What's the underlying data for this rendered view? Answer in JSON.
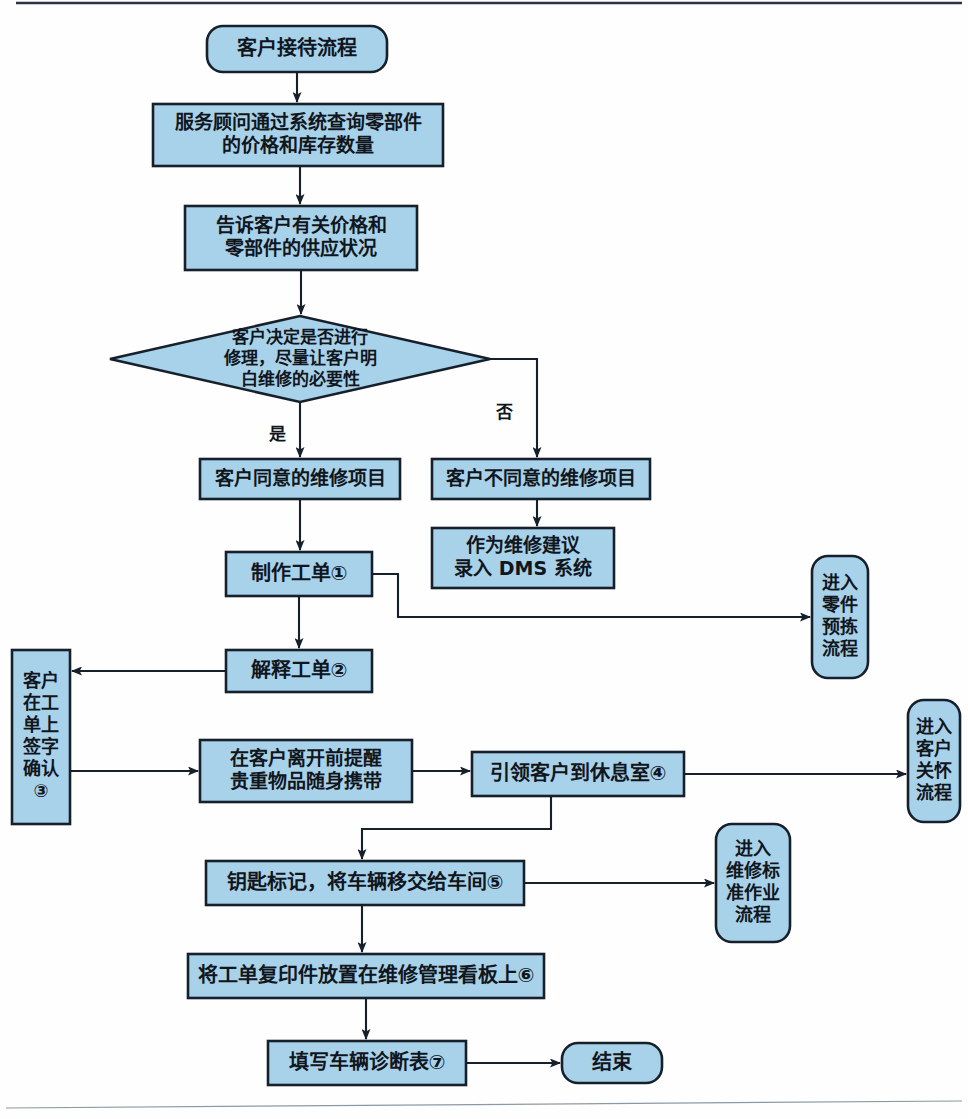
{
  "diagram": {
    "title": "客户接待流程",
    "type": "flowchart",
    "orientation": "top-to-bottom",
    "palette": {
      "node_fill": "#a8d1ea",
      "node_stroke": "#16202b",
      "connector": "#16202b",
      "background": "#fefefe",
      "text": "#10161c"
    },
    "nodes": [
      {
        "id": "start",
        "shape": "rounded",
        "label": "客户接待流程",
        "lines": [
          "客户接待流程"
        ],
        "x": 207,
        "y": 26,
        "w": 180,
        "h": 46,
        "font_size": 20
      },
      {
        "id": "query-parts",
        "shape": "rect",
        "label": "服务顾问通过系统查询零部件的价格和库存数量",
        "lines": [
          "服务顾问通过系统查询零部件",
          "的价格和库存数量"
        ],
        "x": 153,
        "y": 104,
        "w": 290,
        "h": 62,
        "font_size": 19
      },
      {
        "id": "tell-customer",
        "shape": "rect",
        "label": "告诉客户有关价格和零部件的供应状况",
        "lines": [
          "告诉客户有关价格和",
          "零部件的供应状况"
        ],
        "x": 185,
        "y": 206,
        "w": 232,
        "h": 64,
        "font_size": 19
      },
      {
        "id": "decision-repair",
        "shape": "diamond",
        "label": "客户决定是否进行修理，尽量让客户明白维修的必要性",
        "lines": [
          "客户决定是否进行",
          "修理，尽量让客户明",
          "白维修的必要性"
        ],
        "x": 110,
        "y": 316,
        "w": 380,
        "h": 86,
        "font_size": 17
      },
      {
        "id": "agree-items",
        "shape": "rect",
        "label": "客户同意的维修项目",
        "lines": [
          "客户同意的维修项目"
        ],
        "x": 200,
        "y": 459,
        "w": 200,
        "h": 40,
        "font_size": 19
      },
      {
        "id": "disagree-items",
        "shape": "rect",
        "label": "客户不同意的维修项目",
        "lines": [
          "客户不同意的维修项目"
        ],
        "x": 432,
        "y": 459,
        "w": 218,
        "h": 40,
        "font_size": 19
      },
      {
        "id": "dms-advice",
        "shape": "rect",
        "label": "作为维修建议录入 DMS 系统",
        "lines": [
          "作为维修建议",
          "录入 DMS 系统"
        ],
        "x": 432,
        "y": 528,
        "w": 182,
        "h": 60,
        "font_size": 19
      },
      {
        "id": "create-workorder",
        "shape": "rect",
        "label": "制作工单①",
        "lines": [
          "制作工单①"
        ],
        "x": 226,
        "y": 552,
        "w": 146,
        "h": 44,
        "font_size": 20
      },
      {
        "id": "enter-parts-picking",
        "shape": "rounded-vertical",
        "label": "进入零件预拣流程",
        "lines": [
          "进入",
          "零件",
          "预拣",
          "流程"
        ],
        "x": 812,
        "y": 556,
        "w": 56,
        "h": 122,
        "font_size": 18
      },
      {
        "id": "explain-workorder",
        "shape": "rect",
        "label": "解释工单②",
        "lines": [
          "解释工单②"
        ],
        "x": 226,
        "y": 650,
        "w": 146,
        "h": 42,
        "font_size": 20
      },
      {
        "id": "customer-sign",
        "shape": "rect-vertical",
        "label": "客户在工单上签字确认③",
        "lines": [
          "客户",
          "在工",
          "单上",
          "签字",
          "确认",
          "③"
        ],
        "x": 12,
        "y": 650,
        "w": 58,
        "h": 174,
        "font_size": 18
      },
      {
        "id": "remind-valuables",
        "shape": "rect",
        "label": "在客户离开前提醒贵重物品随身携带",
        "lines": [
          "在客户离开前提醒",
          "贵重物品随身携带"
        ],
        "x": 200,
        "y": 740,
        "w": 212,
        "h": 62,
        "font_size": 19
      },
      {
        "id": "lead-lounge",
        "shape": "rect",
        "label": "引领客户到休息室④",
        "lines": [
          "引领客户到休息室④"
        ],
        "x": 472,
        "y": 752,
        "w": 212,
        "h": 44,
        "font_size": 20
      },
      {
        "id": "enter-customer-care",
        "shape": "rounded-vertical",
        "label": "进入客户关怀流程",
        "lines": [
          "进入",
          "客户",
          "关怀",
          "流程"
        ],
        "x": 908,
        "y": 700,
        "w": 52,
        "h": 122,
        "font_size": 18
      },
      {
        "id": "key-tag-handover",
        "shape": "rect",
        "label": "钥匙标记，将车辆移交给车间⑤",
        "lines": [
          "钥匙标记，将车辆移交给车间⑤"
        ],
        "x": 206,
        "y": 861,
        "w": 318,
        "h": 44,
        "font_size": 20
      },
      {
        "id": "enter-repair-standard",
        "shape": "rounded-vertical",
        "label": "进入维修标准作业流程",
        "lines": [
          "进入",
          "维修标",
          "准作业",
          "流程"
        ],
        "x": 716,
        "y": 824,
        "w": 74,
        "h": 118,
        "font_size": 18
      },
      {
        "id": "copy-to-board",
        "shape": "rect",
        "label": "将工单复印件放置在维修管理看板上⑥",
        "lines": [
          "将工单复印件放置在维修管理看板上⑥"
        ],
        "x": 188,
        "y": 954,
        "w": 356,
        "h": 44,
        "font_size": 20
      },
      {
        "id": "fill-diagnosis",
        "shape": "rect",
        "label": "填写车辆诊断表⑦",
        "lines": [
          "填写车辆诊断表⑦"
        ],
        "x": 268,
        "y": 1041,
        "w": 198,
        "h": 44,
        "font_size": 20
      },
      {
        "id": "end",
        "shape": "rounded",
        "label": "结束",
        "lines": [
          "结束"
        ],
        "x": 562,
        "y": 1043,
        "w": 100,
        "h": 40,
        "font_size": 20
      }
    ],
    "edge_labels": [
      {
        "id": "yes",
        "text": "是",
        "x": 277,
        "y": 440
      },
      {
        "id": "no",
        "text": "否",
        "x": 504,
        "y": 418
      }
    ],
    "connectors": [
      {
        "id": "start-to-query",
        "path": "M 297 72 L 297 102",
        "arrow": true
      },
      {
        "id": "query-to-tell",
        "path": "M 300 166 L 300 204",
        "arrow": true
      },
      {
        "id": "tell-to-decision",
        "path": "M 301 270 L 301 314",
        "arrow": true
      },
      {
        "id": "decision-to-agree",
        "path": "M 300 402 L 300 457",
        "arrow": true
      },
      {
        "id": "decision-to-disagree",
        "path": "M 490 359 L 537 359 L 537 457",
        "arrow": true
      },
      {
        "id": "disagree-to-dms",
        "path": "M 537 499 L 537 526",
        "arrow": true
      },
      {
        "id": "agree-to-create",
        "path": "M 300 499 L 300 550",
        "arrow": true
      },
      {
        "id": "create-to-parts-picking",
        "path": "M 372 574 L 398 574 L 398 617 L 810 617",
        "arrow": true
      },
      {
        "id": "create-to-explain",
        "path": "M 299 596 L 299 648",
        "arrow": true
      },
      {
        "id": "explain-to-sign",
        "path": "M 226 671 L 72 671",
        "arrow": true
      },
      {
        "id": "sign-to-remind",
        "path": "M 70 771 L 198 771",
        "arrow": true
      },
      {
        "id": "remind-to-lead",
        "path": "M 412 771 L 470 771",
        "arrow": true
      },
      {
        "id": "lead-to-care",
        "path": "M 684 774 L 906 774",
        "arrow": true
      },
      {
        "id": "lead-to-key",
        "path": "M 551 796 L 551 829 L 362 829 L 362 859",
        "arrow": true
      },
      {
        "id": "key-to-repair-standard",
        "path": "M 524 883 L 714 883",
        "arrow": true
      },
      {
        "id": "key-to-copy",
        "path": "M 362 905 L 362 952",
        "arrow": true
      },
      {
        "id": "copy-to-fill",
        "path": "M 366 998 L 366 1039",
        "arrow": true
      },
      {
        "id": "fill-to-end",
        "path": "M 466 1063 L 560 1063",
        "arrow": true
      }
    ],
    "page_rules": [
      {
        "id": "top-rule",
        "path": "M 16 3 L 962 3"
      },
      {
        "id": "bottom-rule",
        "path": "M 6 1108 L 962 1101"
      }
    ]
  }
}
